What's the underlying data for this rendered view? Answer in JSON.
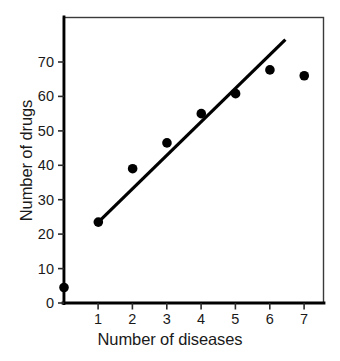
{
  "chart_data": {
    "type": "scatter",
    "title": "",
    "xlabel": "Number of diseases",
    "ylabel": "Number of drugs",
    "xlim": [
      -0.35,
      7.6
    ],
    "ylim": [
      0,
      78
    ],
    "grid": false,
    "legend": null,
    "x_ticks": [
      1,
      2,
      3,
      4,
      5,
      6,
      7
    ],
    "x_tick_labels": [
      "1",
      "2",
      "3",
      "4",
      "5",
      "6",
      "7"
    ],
    "y_ticks": [
      0,
      10,
      20,
      30,
      40,
      50,
      60,
      70
    ],
    "y_tick_labels": [
      "0",
      "10",
      "20",
      "30",
      "40",
      "50",
      "60",
      "70"
    ],
    "x": [
      0,
      1,
      2,
      3,
      4,
      5,
      6,
      7
    ],
    "y": [
      4.5,
      23.5,
      39,
      46.5,
      55,
      60.8,
      67.7,
      66
    ],
    "points": [
      {
        "x": 0,
        "y": 4.5
      },
      {
        "x": 1,
        "y": 23.5
      },
      {
        "x": 2,
        "y": 39
      },
      {
        "x": 3,
        "y": 46.5
      },
      {
        "x": 4,
        "y": 55
      },
      {
        "x": 5,
        "y": 60.8
      },
      {
        "x": 6,
        "y": 67.7
      },
      {
        "x": 7,
        "y": 66
      }
    ],
    "marker": {
      "shape": "circle",
      "color": "#000000",
      "size_px": 5.2
    },
    "trendline": {
      "type": "line",
      "color": "#000000",
      "width_px": 3.2,
      "x_start": 1.0,
      "y_start": 23.5,
      "x_end": 6.45,
      "y_end": 76.5
    },
    "axes_style": {
      "frame": "box",
      "frame_color": "#2b2b2b",
      "frame_width_px": 1.6,
      "axis_color": "#000000",
      "axis_width_px": 2.6,
      "tick_direction": "out"
    }
  }
}
